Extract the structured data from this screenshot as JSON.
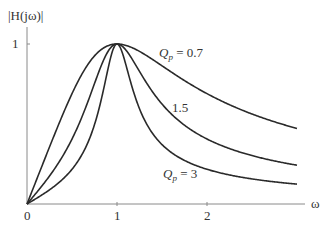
{
  "chart_data": {
    "type": "line",
    "title": "",
    "xlabel": "ω",
    "ylabel": "|H(jω)|",
    "x_ticks": [
      "0",
      "1",
      "2"
    ],
    "y_ticks": [
      "1"
    ],
    "xlim": [
      0,
      3.0
    ],
    "ylim": [
      0,
      1.0
    ],
    "grid": false,
    "legend": "inline labels on curves",
    "formula": "|H(jω)| = 1 / sqrt(1 + Qp^2 (ω - 1/ω)^2)",
    "x": [
      0,
      0.25,
      0.5,
      0.75,
      1.0,
      1.5,
      2.0,
      2.5,
      3.0
    ],
    "series": [
      {
        "name": "Qp = 0.7",
        "Qp": 0.7,
        "values": [
          0,
          0.36,
          0.69,
          0.93,
          1.0,
          0.86,
          0.69,
          0.57,
          0.47
        ]
      },
      {
        "name": "1.5",
        "Qp": 1.5,
        "values": [
          0,
          0.18,
          0.41,
          0.79,
          1.0,
          0.6,
          0.41,
          0.31,
          0.24
        ]
      },
      {
        "name": "Qp = 3",
        "Qp": 3,
        "values": [
          0,
          0.09,
          0.22,
          0.56,
          1.0,
          0.36,
          0.22,
          0.16,
          0.12
        ]
      }
    ],
    "annotations": [
      "Qp = 0.7",
      "1.5",
      "Qp = 3"
    ]
  },
  "labels": {
    "ylabel": "|H(jω)|",
    "xlabel": "ω",
    "xtick0": "0",
    "xtick1": "1",
    "xtick2": "2",
    "ytick1": "1",
    "q07_prefix": "Q",
    "q07_sub": "p",
    "q07_value": " = 0.7",
    "q15": "1.5",
    "q3_prefix": "Q",
    "q3_sub": "p",
    "q3_value": " = 3"
  },
  "colors": {
    "curve": "#2a2a2a",
    "axis": "#888888",
    "text": "#333333"
  }
}
